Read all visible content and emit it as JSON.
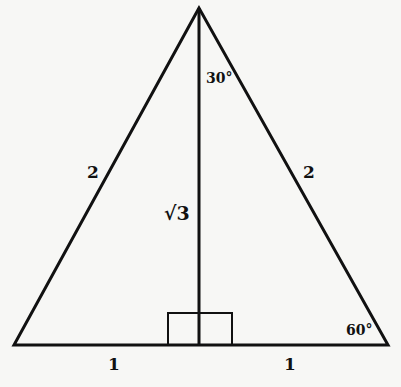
{
  "diagram": {
    "type": "equilateral-triangle-with-altitude",
    "stroke_color": "#111111",
    "background": "#f7f7f5",
    "vertices": {
      "apex": [
        199,
        8
      ],
      "left": [
        14,
        345
      ],
      "right": [
        388,
        345
      ]
    },
    "altitude": {
      "from": [
        199,
        8
      ],
      "to": [
        199,
        345
      ]
    },
    "right_angle_box": {
      "x1": 168,
      "x2": 232,
      "y_top": 313,
      "y_base": 345
    },
    "labels": {
      "left_side": "2",
      "right_side": "2",
      "altitude": "√3",
      "apex_angle": "30°",
      "base_angle": "60°",
      "base_left": "1",
      "base_right": "1"
    }
  }
}
